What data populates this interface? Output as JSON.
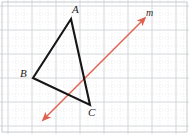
{
  "figure": {
    "width": 189,
    "height": 134,
    "background_color": "#ffffff"
  },
  "grid": {
    "major_color": "#cfd2d6",
    "minor_color": "#d8dbdf",
    "border_color": "#c6c9cd",
    "major_spacing": 24,
    "minor_spacing": 8,
    "major_x_positions": [
      8,
      32,
      56,
      80,
      104,
      128,
      152,
      176
    ],
    "major_y_positions": [
      6,
      30,
      54,
      78,
      102,
      126
    ],
    "minor_x_positions": [
      16,
      24,
      40,
      48,
      64,
      72,
      88,
      96,
      112,
      120,
      136,
      144,
      160,
      168,
      184
    ],
    "minor_y_positions": [
      14,
      22,
      38,
      46,
      62,
      70,
      86,
      94,
      110,
      118
    ],
    "border_inset": 2
  },
  "triangle": {
    "name": "triangle-abc",
    "stroke_color": "#161616",
    "stroke_width": 2.1,
    "vertices": [
      {
        "id": "A",
        "label": "A",
        "x": 71,
        "y": 19,
        "label_x": 72,
        "label_y": 4
      },
      {
        "id": "B",
        "label": "B",
        "x": 33,
        "y": 78,
        "label_x": 20,
        "label_y": 68
      },
      {
        "id": "C",
        "label": "C",
        "x": 90,
        "y": 105,
        "label_x": 88,
        "label_y": 107
      }
    ],
    "path": "M 71 19 L 33 78 L 90 105 Z"
  },
  "line": {
    "id": "m",
    "label": "m",
    "name": "line-m",
    "stroke_color": "#e06050",
    "stroke_width": 1.5,
    "arrowhead_color": "#e06050",
    "start_x": 45,
    "start_y": 118,
    "end_x": 143,
    "end_y": 20,
    "label_x": 146,
    "label_y": 7,
    "double_headed": true
  }
}
